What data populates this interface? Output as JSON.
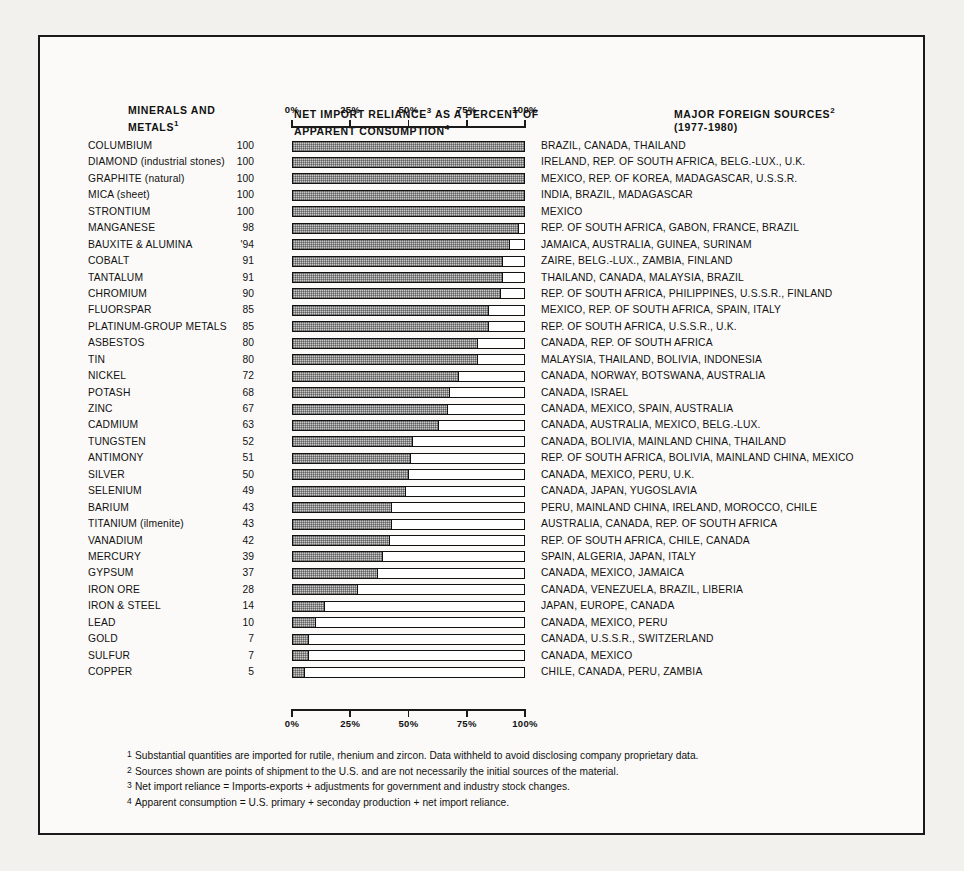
{
  "headers": {
    "minerals": "MINERALS AND METALS",
    "minerals_line1": "MINERALS AND",
    "minerals_line2": "METALS",
    "minerals_footnote_ref": "1",
    "nir_line1": "NET IMPORT RELIANCE",
    "nir_ref1": "3",
    "nir_line1b": " AS A PERCENT OF",
    "nir_line2": "APPARENT CONSUMPTION",
    "nir_ref2": "4",
    "sources_line1": "MAJOR FOREIGN SOURCES",
    "sources_ref": "2",
    "sources_line2": "(1977-1980)"
  },
  "axis": {
    "ticks": [
      "0%",
      "25%",
      "50%",
      "75%",
      "100%"
    ],
    "min": 0,
    "max": 100
  },
  "footnotes": [
    {
      "ref": "1",
      "text": "Substantial quantities are imported for rutile, rhenium and zircon. Data withheld to avoid disclosing company proprietary data."
    },
    {
      "ref": "2",
      "text": "Sources shown are points of shipment to the U.S. and are not necessarily the initial sources of the material."
    },
    {
      "ref": "3",
      "text": "Net import reliance = Imports-exports + adjustments for government and industry stock changes."
    },
    {
      "ref": "4",
      "text": "Apparent consumption = U.S. primary + seconday production + net import reliance."
    }
  ],
  "chart_data": {
    "type": "bar",
    "xlabel": "Percent of apparent consumption",
    "ylabel": "Minerals and metals",
    "xlim": [
      0,
      100
    ],
    "orientation": "horizontal",
    "grid": false,
    "legend": "none",
    "tick_labels": [
      "0%",
      "25%",
      "50%",
      "75%",
      "100%"
    ],
    "categories": [
      "COLUMBIUM",
      "DIAMOND (industrial stones)",
      "GRAPHITE (natural)",
      "MICA (sheet)",
      "STRONTIUM",
      "MANGANESE",
      "BAUXITE & ALUMINA",
      "COBALT",
      "TANTALUM",
      "CHROMIUM",
      "FLUORSPAR",
      "PLATINUM-GROUP METALS",
      "ASBESTOS",
      "TIN",
      "NICKEL",
      "POTASH",
      "ZINC",
      "CADMIUM",
      "TUNGSTEN",
      "ANTIMONY",
      "SILVER",
      "SELENIUM",
      "BARIUM",
      "TITANIUM (ilmenite)",
      "VANADIUM",
      "MERCURY",
      "GYPSUM",
      "IRON ORE",
      "IRON & STEEL",
      "LEAD",
      "GOLD",
      "SULFUR",
      "COPPER"
    ],
    "values": [
      100,
      100,
      100,
      100,
      100,
      98,
      94,
      91,
      91,
      90,
      85,
      85,
      80,
      80,
      72,
      68,
      67,
      63,
      52,
      51,
      50,
      49,
      43,
      43,
      42,
      39,
      37,
      28,
      14,
      10,
      7,
      7,
      5
    ],
    "value_labels": [
      "100",
      "100",
      "100",
      "100",
      "100",
      "98",
      "'94",
      "91",
      "91",
      "90",
      "85",
      "85",
      "80",
      "80",
      "72",
      "68",
      "67",
      "63",
      "52",
      "51",
      "50",
      "49",
      "43",
      "43",
      "42",
      "39",
      "37",
      "28",
      "14",
      "10",
      "7",
      "7",
      "5"
    ],
    "sources": [
      "BRAZIL, CANADA, THAILAND",
      "IRELAND, REP. OF SOUTH AFRICA, BELG.-LUX., U.K.",
      "MEXICO, REP. OF KOREA, MADAGASCAR, U.S.S.R.",
      "INDIA, BRAZIL, MADAGASCAR",
      "MEXICO",
      "REP. OF SOUTH AFRICA, GABON, FRANCE, BRAZIL",
      "JAMAICA, AUSTRALIA, GUINEA, SURINAM",
      "ZAIRE, BELG.-LUX., ZAMBIA, FINLAND",
      "THAILAND, CANADA, MALAYSIA, BRAZIL",
      "REP. OF SOUTH AFRICA, PHILIPPINES, U.S.S.R., FINLAND",
      "MEXICO, REP. OF SOUTH AFRICA, SPAIN, ITALY",
      "REP. OF SOUTH AFRICA, U.S.S.R., U.K.",
      "CANADA, REP. OF SOUTH AFRICA",
      "MALAYSIA, THAILAND, BOLIVIA, INDONESIA",
      "CANADA, NORWAY, BOTSWANA, AUSTRALIA",
      "CANADA, ISRAEL",
      "CANADA, MEXICO, SPAIN, AUSTRALIA",
      "CANADA, AUSTRALIA, MEXICO, BELG.-LUX.",
      "CANADA, BOLIVIA, MAINLAND CHINA, THAILAND",
      "REP. OF SOUTH AFRICA, BOLIVIA, MAINLAND CHINA, MEXICO",
      "CANADA, MEXICO, PERU, U.K.",
      "CANADA, JAPAN, YUGOSLAVIA",
      "PERU, MAINLAND CHINA, IRELAND, MOROCCO, CHILE",
      "AUSTRALIA, CANADA, REP. OF SOUTH AFRICA",
      "REP. OF SOUTH AFRICA, CHILE, CANADA",
      "SPAIN, ALGERIA, JAPAN, ITALY",
      "CANADA, MEXICO, JAMAICA",
      "CANADA, VENEZUELA, BRAZIL, LIBERIA",
      "JAPAN, EUROPE, CANADA",
      "CANADA, MEXICO, PERU",
      "CANADA, U.S.S.R., SWITZERLAND",
      "CANADA, MEXICO",
      "CHILE, CANADA, PERU, ZAMBIA"
    ],
    "colors": {
      "bar_fill": "#c9c9c9",
      "bar_outline": "#111111",
      "background": "#fbfaf8",
      "text": "#111111"
    }
  }
}
